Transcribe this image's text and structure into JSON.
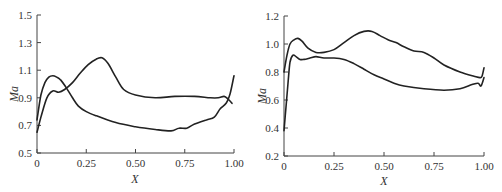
{
  "chart_data": [
    {
      "type": "line",
      "title": "",
      "xlabel": "X",
      "ylabel": "Ma",
      "xlim": [
        0,
        1.0
      ],
      "ylim": [
        0.5,
        1.5
      ],
      "x_ticks": [
        "0",
        "0.25",
        "0.50",
        "0.75",
        "1.00"
      ],
      "y_ticks": [
        "0.5",
        "0.7",
        "0.9",
        "1.1",
        "1.3",
        "1.5"
      ],
      "grid": false,
      "legend": null,
      "series": [
        {
          "name": "curve-1",
          "x": [
            0.0,
            0.02,
            0.04,
            0.06,
            0.08,
            0.1,
            0.12,
            0.15,
            0.18,
            0.21,
            0.25,
            0.3,
            0.4,
            0.5,
            0.6,
            0.68,
            0.72,
            0.76,
            0.8,
            0.86,
            0.9,
            0.93,
            0.96,
            0.98,
            1.0
          ],
          "y": [
            0.74,
            0.92,
            1.01,
            1.05,
            1.06,
            1.05,
            1.03,
            0.97,
            0.9,
            0.84,
            0.8,
            0.77,
            0.72,
            0.69,
            0.67,
            0.66,
            0.68,
            0.68,
            0.71,
            0.74,
            0.76,
            0.82,
            0.86,
            0.93,
            1.06
          ]
        },
        {
          "name": "curve-2",
          "x": [
            0.0,
            0.02,
            0.05,
            0.08,
            0.11,
            0.14,
            0.18,
            0.22,
            0.26,
            0.3,
            0.33,
            0.36,
            0.4,
            0.44,
            0.5,
            0.6,
            0.7,
            0.8,
            0.88,
            0.92,
            0.95,
            0.97,
            0.99
          ],
          "y": [
            0.65,
            0.76,
            0.9,
            0.95,
            0.94,
            0.96,
            1.01,
            1.08,
            1.14,
            1.18,
            1.19,
            1.15,
            1.05,
            0.96,
            0.92,
            0.9,
            0.91,
            0.91,
            0.9,
            0.9,
            0.91,
            0.89,
            0.86
          ]
        }
      ]
    },
    {
      "type": "line",
      "title": "",
      "xlabel": "X",
      "ylabel": "Ma",
      "xlim": [
        0,
        1.0
      ],
      "ylim": [
        0.2,
        1.2
      ],
      "x_ticks": [
        "0",
        "0.25",
        "0.50",
        "0.75",
        "1.00"
      ],
      "y_ticks": [
        "0.2",
        "0.4",
        "0.6",
        "0.8",
        "1.0",
        "1.2"
      ],
      "grid": false,
      "legend": null,
      "series": [
        {
          "name": "curve-upper",
          "x": [
            0.0,
            0.015,
            0.03,
            0.05,
            0.07,
            0.09,
            0.12,
            0.16,
            0.2,
            0.25,
            0.3,
            0.35,
            0.4,
            0.44,
            0.48,
            0.52,
            0.56,
            0.6,
            0.65,
            0.7,
            0.75,
            0.8,
            0.88,
            0.95,
            0.98,
            0.99,
            1.0
          ],
          "y": [
            0.8,
            0.92,
            1.0,
            1.03,
            1.04,
            1.02,
            0.97,
            0.94,
            0.94,
            0.96,
            1.01,
            1.06,
            1.09,
            1.09,
            1.06,
            1.03,
            1.01,
            0.98,
            0.95,
            0.94,
            0.9,
            0.85,
            0.8,
            0.77,
            0.76,
            0.77,
            0.83
          ]
        },
        {
          "name": "curve-lower",
          "x": [
            0.0,
            0.01,
            0.02,
            0.03,
            0.045,
            0.06,
            0.08,
            0.1,
            0.13,
            0.16,
            0.2,
            0.25,
            0.3,
            0.35,
            0.4,
            0.45,
            0.5,
            0.55,
            0.6,
            0.7,
            0.8,
            0.88,
            0.94,
            0.97,
            0.985,
            1.0
          ],
          "y": [
            0.38,
            0.55,
            0.72,
            0.87,
            0.92,
            0.91,
            0.89,
            0.89,
            0.9,
            0.91,
            0.9,
            0.9,
            0.89,
            0.86,
            0.82,
            0.78,
            0.75,
            0.72,
            0.7,
            0.68,
            0.67,
            0.68,
            0.71,
            0.72,
            0.7,
            0.76
          ]
        }
      ]
    }
  ]
}
